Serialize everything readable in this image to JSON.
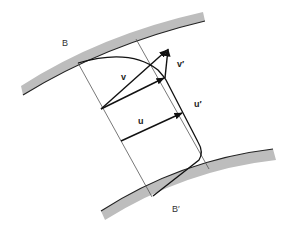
{
  "diagram": {
    "colors": {
      "boundary_fill": "#bdbdbd",
      "boundary_edge": "#222222",
      "thin_line": "#555555",
      "vector": "#111111",
      "label": "#333333"
    },
    "labels": {
      "upper_boundary": "B",
      "lower_boundary": "B′",
      "vector_v": "v",
      "vector_v_prime": "v′",
      "vector_u": "u",
      "vector_u_prime": "u′"
    }
  }
}
